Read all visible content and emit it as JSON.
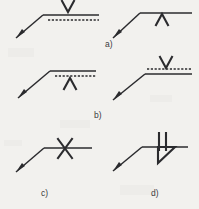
{
  "figure": {
    "background_color": "#f2f1ee",
    "ink_color": "#2b2b2e",
    "captions": {
      "a": "a)",
      "b": "b)",
      "c": "c)",
      "d": "d)"
    },
    "symbols": [
      {
        "id": "top-left",
        "group": "a",
        "weld_symbol": "V",
        "symbol_glyph": "V",
        "symbol_side": "above-reference-line",
        "symbol_clipped_by_image_edge": "true",
        "reference_line": "solid",
        "identification_line": "dashed",
        "identification_line_position": "below",
        "leader_arrow_direction": "down-left",
        "arrowhead": "solid-filled"
      },
      {
        "id": "top-right",
        "group": "a",
        "weld_symbol": "V-up",
        "symbol_glyph": "∧",
        "symbol_side": "below-reference-line",
        "symbol_clipped_by_image_edge": "false",
        "reference_line": "solid",
        "identification_line": "none",
        "identification_line_position": "none",
        "leader_arrow_direction": "down-left",
        "arrowhead": "solid-filled"
      },
      {
        "id": "middle-left",
        "group": "b",
        "weld_symbol": "V-up",
        "symbol_glyph": "∧",
        "symbol_side": "below-identification-line",
        "symbol_clipped_by_image_edge": "false",
        "reference_line": "solid",
        "identification_line": "dashed",
        "identification_line_position": "below",
        "leader_arrow_direction": "down-left",
        "arrowhead": "solid-filled"
      },
      {
        "id": "middle-right",
        "group": "b",
        "weld_symbol": "V",
        "symbol_glyph": "V",
        "symbol_side": "above-identification-line",
        "symbol_clipped_by_image_edge": "false",
        "reference_line": "solid",
        "identification_line": "dashed",
        "identification_line_position": "above",
        "leader_arrow_direction": "down-left",
        "arrowhead": "solid-filled"
      },
      {
        "id": "bottom-left",
        "group": "c",
        "weld_symbol": "X",
        "symbol_glyph": "X",
        "symbol_side": "straddling-reference-line",
        "symbol_clipped_by_image_edge": "false",
        "reference_line": "solid",
        "identification_line": "none",
        "identification_line_position": "none",
        "leader_arrow_direction": "down-left",
        "arrowhead": "solid-filled"
      },
      {
        "id": "bottom-right",
        "group": "d",
        "weld_symbol": "double-stroke-with-triangle",
        "symbol_glyph": "↯",
        "symbol_side": "straddling-reference-line",
        "symbol_clipped_by_image_edge": "false",
        "reference_line": "solid",
        "identification_line": "none",
        "identification_line_position": "none",
        "leader_arrow_direction": "down-left",
        "arrowhead": "solid-filled"
      }
    ]
  }
}
